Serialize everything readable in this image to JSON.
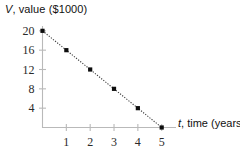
{
  "chart_data": {
    "type": "line",
    "title": "",
    "subtitle": "",
    "xlabel": "t, time (years)",
    "ylabel": "V, value ($1000)",
    "xlabel_variable": "t",
    "xlabel_rest": ", time (years)",
    "ylabel_variable": "V",
    "ylabel_rest": ", value ($1000)",
    "x": [
      0,
      1,
      2,
      3,
      4,
      5
    ],
    "values": [
      20,
      16,
      12,
      8,
      4,
      0
    ],
    "series": [
      {
        "name": "V = 20 - 4t",
        "values": [
          20,
          16,
          12,
          8,
          4,
          0
        ]
      }
    ],
    "points": [
      {
        "t": 0,
        "v": 20
      },
      {
        "t": 1,
        "v": 16
      },
      {
        "t": 2,
        "v": 12
      },
      {
        "t": 3,
        "v": 8
      },
      {
        "t": 4,
        "v": 4
      },
      {
        "t": 5,
        "v": 0
      }
    ],
    "xticks": [
      1,
      2,
      3,
      4,
      5
    ],
    "xtick_labels": [
      "1",
      "2",
      "3",
      "4",
      "5"
    ],
    "yticks": [
      4,
      8,
      12,
      16,
      20
    ],
    "ytick_labels": [
      "4",
      "8",
      "12",
      "16",
      "20"
    ],
    "xlim": [
      0,
      5.6
    ],
    "ylim": [
      0,
      21
    ],
    "grid": false,
    "legend": false,
    "legend_position": "none",
    "line_style": "dotted",
    "marker_style": "square",
    "marker_color": "#0d0d0d",
    "line_color": "#3d3d3d",
    "axis_color": "#b9b9b9",
    "background_color": "#ffffff"
  }
}
